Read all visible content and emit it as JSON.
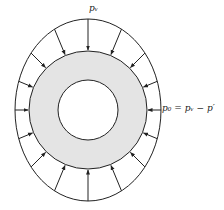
{
  "diagram": {
    "labels": {
      "top": "pᵥ",
      "right": "p₀ = pᵥ − p′"
    },
    "colors": {
      "stroke": "#222222",
      "annulus_fill": "#e4e4e4",
      "background": "#ffffff"
    },
    "geometry": {
      "center": [
        88,
        110
      ],
      "outer_boundary": {
        "rx": 73,
        "ry": 91
      },
      "annulus_outer_r": 59,
      "inner_hole_r": 30
    },
    "arrows": {
      "count": 16,
      "direction": "inward toward annulus"
    }
  }
}
